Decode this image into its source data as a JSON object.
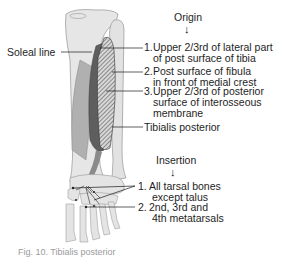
{
  "figure": {
    "subject": "Tibialis posterior",
    "labels": {
      "soleal_line": "Soleal line",
      "muscle_name": "Tibialis posterior"
    },
    "origin": {
      "heading": "Origin",
      "arrow": "↓",
      "items": [
        {
          "num": "1.",
          "line1": "Upper 2/3rd of lateral part",
          "line2": "of post surface of tibia"
        },
        {
          "num": "2.",
          "line1": "Post surface of fibula",
          "line2": "in front of medial crest"
        },
        {
          "num": "3.",
          "line1": "Upper 2/3rd of posterior",
          "line2": "surface of interosseous",
          "line3": "membrane"
        }
      ]
    },
    "insertion": {
      "heading": "Insertion",
      "arrow": "↓",
      "items": [
        {
          "num": "1.",
          "line1": "All tarsal bones",
          "line2": "except talus"
        },
        {
          "num": "2.",
          "line1": "2nd, 3rd and",
          "line2": "4th metatarsals"
        }
      ]
    },
    "caption_partial": "Fig. 10.  Tibialis posterior"
  },
  "colors": {
    "bone": "#e4e4e4",
    "bone_outline": "#9a9a9a",
    "muscle_dark": "#5a5a5a",
    "muscle_light": "#9c9c9c",
    "hatch": "#444444",
    "leader": "#1a1a1a"
  }
}
